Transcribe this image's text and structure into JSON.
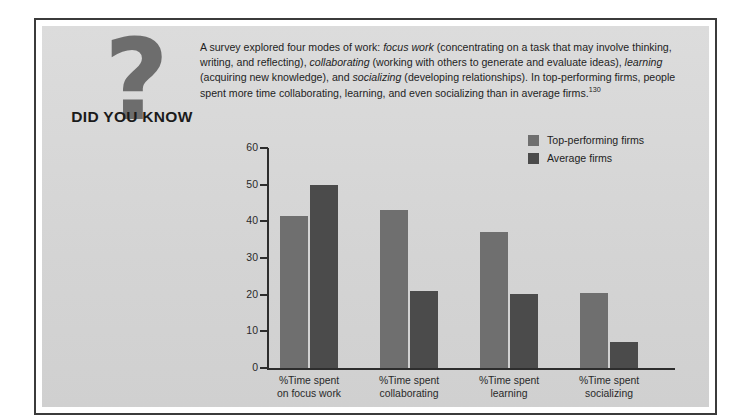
{
  "badge": {
    "icon": "question-mark-icon",
    "glyph": "?",
    "label": "DID YOU KNOW"
  },
  "intro": {
    "segments": [
      {
        "text": "A survey explored four modes of work: ",
        "style": "normal"
      },
      {
        "text": "focus work",
        "style": "italic"
      },
      {
        "text": " (concentrating on a task that may involve thinking, writing, and reflecting), ",
        "style": "normal"
      },
      {
        "text": "collaborating",
        "style": "italic"
      },
      {
        "text": " (working with others to generate and evaluate ideas), ",
        "style": "normal"
      },
      {
        "text": "learning",
        "style": "italic"
      },
      {
        "text": " (acquiring new knowledge), and ",
        "style": "normal"
      },
      {
        "text": "socializing",
        "style": "italic"
      },
      {
        "text": " (developing relationships). In top-performing firms, people spent more time collaborating, learning, and even socializing than in average firms.",
        "style": "normal"
      },
      {
        "text": "130",
        "style": "superscript"
      }
    ],
    "full_text": "A survey explored four modes of work: focus work (concentrating on a task that may involve thinking, writing, and reflecting), collaborating (working with others to generate and evaluate ideas), learning (acquiring new knowledge), and socializing (developing relationships). In top-performing firms, people spent more time collaborating, learning, and even socializing than in average firms.130"
  },
  "colors": {
    "panel_background": "#d6d6d6",
    "frame_border": "#3b3b3b",
    "page_background": "#ffffff",
    "series_top_performing": "#6f6f6f",
    "series_average": "#4b4b4b",
    "axis": "#2d2d2d",
    "text": "#1e1e1e",
    "badge_mark": "#6d6d6d"
  },
  "chart_data": {
    "type": "bar",
    "title": "",
    "xlabel": "",
    "ylabel": "",
    "ylim": [
      0,
      60
    ],
    "yticks": [
      0,
      10,
      20,
      30,
      40,
      50,
      60
    ],
    "grid": false,
    "legend_position": "top-right",
    "categories": [
      "%Time spent on focus work",
      "%Time spent collaborating",
      "%Time spent learning",
      "%Time spent socializing"
    ],
    "category_lines": [
      [
        "%Time spent",
        "on focus work"
      ],
      [
        "%Time spent",
        "collaborating"
      ],
      [
        "%Time spent",
        "learning"
      ],
      [
        "%Time spent",
        "socializing"
      ]
    ],
    "series": [
      {
        "name": "Top-performing firms",
        "color": "#6f6f6f",
        "values": [
          41.5,
          43,
          37,
          20.5
        ]
      },
      {
        "name": "Average firms",
        "color": "#4b4b4b",
        "values": [
          50,
          21,
          20.3,
          7
        ]
      }
    ]
  }
}
